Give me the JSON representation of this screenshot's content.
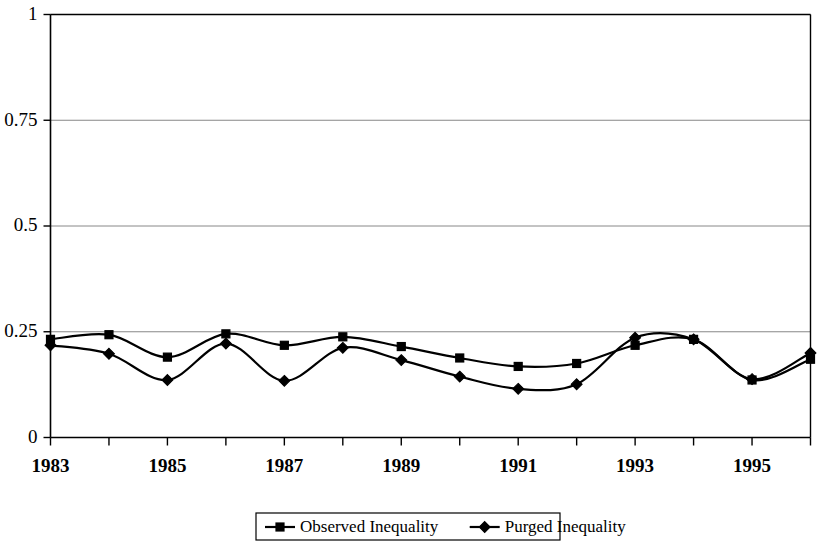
{
  "chart_data": {
    "type": "line",
    "title": "",
    "subtitle": "",
    "xlabel": "",
    "ylabel": "",
    "x": [
      1983,
      1984,
      1985,
      1986,
      1987,
      1988,
      1989,
      1990,
      1991,
      1992,
      1993,
      1994,
      1995,
      1996
    ],
    "categories": [
      "1983",
      "1984",
      "1985",
      "1986",
      "1987",
      "1988",
      "1989",
      "1990",
      "1991",
      "1992",
      "1993",
      "1994",
      "1995",
      "1996"
    ],
    "xtick_labels": [
      "1983",
      "1985",
      "1987",
      "1989",
      "1991",
      "1993",
      "1995"
    ],
    "xtick_values": [
      1983,
      1985,
      1987,
      1989,
      1991,
      1993,
      1995
    ],
    "ytick_labels": [
      "0",
      "0.25",
      "0.5",
      "0.75",
      "1"
    ],
    "ytick_values": [
      0,
      0.25,
      0.5,
      0.75,
      1
    ],
    "xlim": [
      1983,
      1996
    ],
    "ylim": [
      0,
      1
    ],
    "grid": "horizontal",
    "legend_position": "bottom",
    "series": [
      {
        "name": "Observed Inequality",
        "marker": "square",
        "values": [
          0.232,
          0.243,
          0.19,
          0.245,
          0.218,
          0.238,
          0.215,
          0.188,
          0.168,
          0.175,
          0.218,
          0.232,
          0.136,
          0.185
        ]
      },
      {
        "name": "Purged Inequality",
        "marker": "diamond",
        "values": [
          0.218,
          0.198,
          0.136,
          0.222,
          0.134,
          0.212,
          0.183,
          0.144,
          0.115,
          0.126,
          0.236,
          0.232,
          0.138,
          0.2
        ]
      }
    ]
  },
  "legend": {
    "items": [
      {
        "label": "Observed Inequality",
        "marker": "square"
      },
      {
        "label": "Purged Inequality",
        "marker": "diamond"
      }
    ]
  }
}
